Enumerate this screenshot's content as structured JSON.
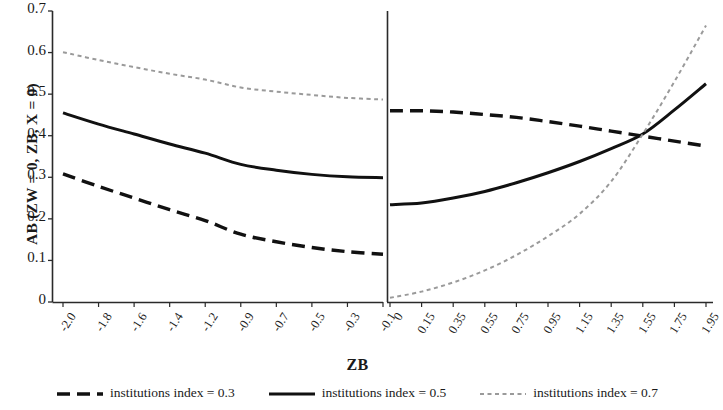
{
  "chart_data": {
    "type": "line",
    "title": "",
    "xlabel": "ZB",
    "ylabel": "AB (ZW = 0, ZB, X = 0)",
    "ylim": [
      0,
      0.7
    ],
    "yticks": [
      "0",
      "0.1",
      "0.2",
      "0.3",
      "0.4",
      "0.5",
      "0.6",
      "0.7"
    ],
    "ytick_values": [
      0,
      0.1,
      0.2,
      0.3,
      0.4,
      0.5,
      0.6,
      0.7
    ],
    "grid": false,
    "legend_position": "bottom",
    "panels": [
      {
        "name": "left-panel",
        "xtick_labels": [
          "-2.0",
          "-1.8",
          "-1.6",
          "-1.4",
          "-1.2",
          "-0.9",
          "-0.7",
          "-0.5",
          "-0.3",
          "-0.1"
        ],
        "x": [
          -2.0,
          -1.8,
          -1.6,
          -1.4,
          -1.2,
          -0.9,
          -0.7,
          -0.5,
          -0.3,
          -0.1
        ],
        "series": [
          {
            "name": "institutions index = 0.3",
            "style": "dashed",
            "color": "#111111",
            "values": [
              0.308,
              0.278,
              0.25,
              0.222,
              0.196,
              0.163,
              0.145,
              0.131,
              0.121,
              0.115
            ]
          },
          {
            "name": "institutions index = 0.5",
            "style": "solid",
            "color": "#111111",
            "values": [
              0.455,
              0.428,
              0.404,
              0.38,
              0.358,
              0.331,
              0.317,
              0.307,
              0.301,
              0.299
            ]
          },
          {
            "name": "institutions index = 0.7",
            "style": "dotted",
            "color": "#9a9a9a",
            "values": [
              0.601,
              0.582,
              0.565,
              0.549,
              0.535,
              0.516,
              0.506,
              0.498,
              0.491,
              0.487
            ]
          }
        ]
      },
      {
        "name": "right-panel",
        "xtick_labels": [
          "0",
          "0.15",
          "0.35",
          "0.55",
          "0.75",
          "0.95",
          "1.15",
          "1.35",
          "1.55",
          "1.75",
          "1.95"
        ],
        "x": [
          0,
          0.15,
          0.35,
          0.55,
          0.75,
          0.95,
          1.15,
          1.35,
          1.55,
          1.75,
          1.95
        ],
        "series": [
          {
            "name": "institutions index = 0.3",
            "style": "dashed",
            "color": "#111111",
            "values": [
              0.46,
              0.46,
              0.457,
              0.451,
              0.444,
              0.434,
              0.423,
              0.411,
              0.399,
              0.387,
              0.375
            ]
          },
          {
            "name": "institutions index = 0.5",
            "style": "solid",
            "color": "#111111",
            "values": [
              0.234,
              0.238,
              0.25,
              0.266,
              0.287,
              0.311,
              0.338,
              0.369,
              0.404,
              0.462,
              0.525
            ]
          },
          {
            "name": "institutions index = 0.7",
            "style": "dotted",
            "color": "#9a9a9a",
            "values": [
              0.01,
              0.025,
              0.047,
              0.076,
              0.113,
              0.158,
              0.212,
              0.29,
              0.404,
              0.53,
              0.665
            ]
          }
        ]
      }
    ],
    "legend": [
      {
        "label": "institutions index = 0.3",
        "style": "dashed",
        "color": "#111111"
      },
      {
        "label": "institutions index = 0.5",
        "style": "solid",
        "color": "#111111"
      },
      {
        "label": "institutions index = 0.7",
        "style": "dotted",
        "color": "#9a9a9a"
      }
    ]
  },
  "axes": {
    "y_title": "AB (ZW = 0, ZB, X = 0)",
    "x_title": "ZB"
  }
}
